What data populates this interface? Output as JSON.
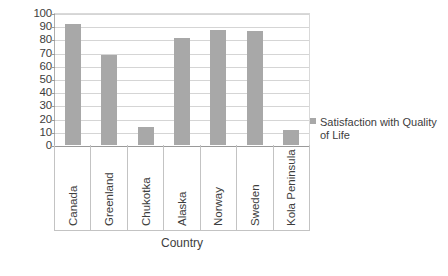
{
  "chart_data": {
    "type": "bar",
    "title": "",
    "xlabel": "Country",
    "ylabel": "",
    "categories": [
      "Canada",
      "Greenland",
      "Chukotka",
      "Alaska",
      "Norway",
      "Sweden",
      "Kola Peninsula"
    ],
    "values": [
      92,
      68,
      14,
      81,
      87,
      86,
      11
    ],
    "series": [
      {
        "name": "Satisfaction with Quality of Life",
        "values": [
          92,
          68,
          14,
          81,
          87,
          86,
          11
        ]
      }
    ],
    "ylim": [
      0,
      100
    ],
    "ytick_step": 10,
    "yticks": [
      100,
      90,
      80,
      70,
      60,
      50,
      40,
      30,
      20,
      10,
      0
    ],
    "grid": true,
    "legend_position": "right",
    "bar_color": "#a8a8a8",
    "gridline_color": "#d5d5d5",
    "axis_color": "#9a9a9a",
    "text_color": "#3d3d3d"
  },
  "legend": {
    "entries": [
      {
        "label_line1": "Satisfaction with Quality",
        "label_line2": "of Life",
        "label_full": "Satisfaction with Quality of Life",
        "swatch_color": "#a8a8a8"
      }
    ]
  },
  "axis": {
    "x_title": "Country"
  }
}
